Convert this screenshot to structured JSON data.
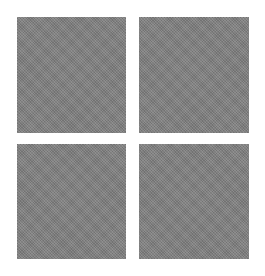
{
  "logo": {
    "name": "four-square-grid",
    "tiles": [
      {
        "position": "top-left",
        "color": "#7f7f7f"
      },
      {
        "position": "top-right",
        "color": "#7f7f7f"
      },
      {
        "position": "bottom-left",
        "color": "#7f7f7f"
      },
      {
        "position": "bottom-right",
        "color": "#7f7f7f"
      }
    ],
    "background": "#ffffff"
  }
}
